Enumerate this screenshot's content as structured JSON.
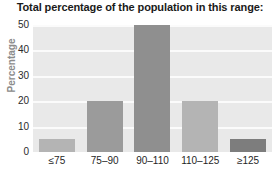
{
  "chart_data": {
    "type": "bar",
    "title": "Total percentage of the population in this range:",
    "xlabel": "",
    "ylabel": "Percentage",
    "categories": [
      "≤75",
      "75–90",
      "90–110",
      "110–125",
      "≥125"
    ],
    "values": [
      5,
      20,
      50,
      20,
      5
    ],
    "ylim": [
      0,
      50
    ],
    "yticks": [
      0,
      10,
      20,
      30,
      40,
      50
    ],
    "ytick_labels": [
      "0",
      "10",
      "20",
      "30",
      "40",
      "50"
    ],
    "grid": true,
    "legend": false,
    "bar_colors": [
      "#b4b4b4",
      "#9b9b9b",
      "#8f8f8f",
      "#b4b4b4",
      "#7d7d7d"
    ],
    "plot_background": "#e9e9e9",
    "gridline_color": "#fbfbfb",
    "title_color": "#1a1a1a",
    "ylabel_color": "#8c8c8c"
  }
}
